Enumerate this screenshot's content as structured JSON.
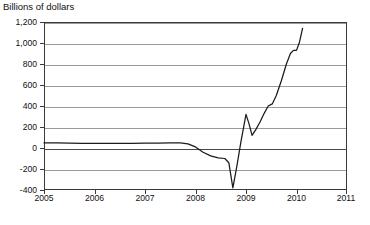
{
  "chart_data": {
    "type": "line",
    "title": "",
    "ylabel": "Billions of dollars",
    "xlabel": "",
    "ylim": [
      -400,
      1200
    ],
    "xlim": [
      2005,
      2011
    ],
    "grid": true,
    "legend": null,
    "y_ticks": [
      "1,200",
      "1,000",
      "800",
      "600",
      "400",
      "200",
      "0",
      "-200",
      "-400"
    ],
    "y_tick_values": [
      1200,
      1000,
      800,
      600,
      400,
      200,
      0,
      -200,
      -400
    ],
    "x_ticks": [
      "2005",
      "2006",
      "2007",
      "2008",
      "2009",
      "2010",
      "2011"
    ],
    "x_tick_values": [
      2005,
      2006,
      2007,
      2008,
      2009,
      2010,
      2011
    ],
    "series": [
      {
        "name": "Billions of dollars",
        "color": "#1b1b1b",
        "x": [
          2005.0,
          2005.25,
          2005.5,
          2005.75,
          2006.0,
          2006.25,
          2006.5,
          2006.75,
          2007.0,
          2007.25,
          2007.5,
          2007.7,
          2007.85,
          2008.0,
          2008.15,
          2008.3,
          2008.45,
          2008.58,
          2008.66,
          2008.74,
          2008.82,
          2008.9,
          2009.0,
          2009.06,
          2009.12,
          2009.2,
          2009.28,
          2009.36,
          2009.44,
          2009.52,
          2009.6,
          2009.7,
          2009.8,
          2009.88,
          2009.94,
          2010.0,
          2010.06,
          2010.12
        ],
        "y": [
          48,
          48,
          46,
          45,
          44,
          43,
          45,
          44,
          46,
          47,
          48,
          48,
          40,
          10,
          -40,
          -75,
          -95,
          -100,
          -140,
          -380,
          -170,
          60,
          320,
          230,
          120,
          180,
          250,
          330,
          400,
          420,
          500,
          640,
          800,
          900,
          930,
          930,
          1010,
          1140
        ]
      }
    ]
  }
}
